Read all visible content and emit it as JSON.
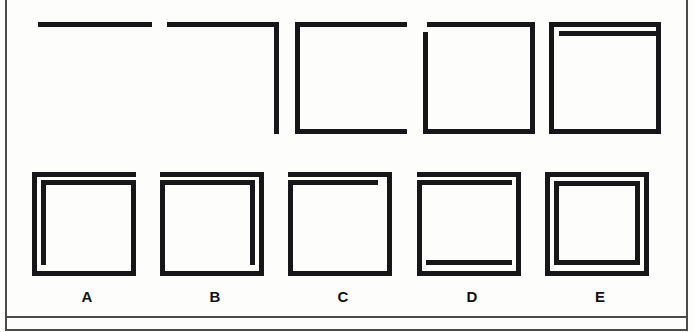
{
  "page": {
    "background_color": "#fdfdfb",
    "ink_color": "#17171a",
    "frame_color": "#4a4a4a"
  },
  "sequence": {
    "name": "problem-sequence",
    "description": "Top row: five progressive figures built from line segments that accumulate one stroke at a time.",
    "items": [
      {
        "index": 1,
        "name": "figure-1",
        "description": "Single horizontal line (top edge only)",
        "stroke_count": 1,
        "strokes": [
          "top"
        ]
      },
      {
        "index": 2,
        "name": "figure-2",
        "description": "Top edge plus right edge, forming an inverted L",
        "stroke_count": 2,
        "strokes": [
          "top",
          "right"
        ]
      },
      {
        "index": 3,
        "name": "figure-3",
        "description": "Top, left and bottom edges, forming a C open to the right",
        "stroke_count": 3,
        "strokes": [
          "top",
          "left",
          "bottom"
        ]
      },
      {
        "index": 4,
        "name": "figure-4",
        "description": "Full square outline with a small gap at the upper-left corner",
        "stroke_count": 4,
        "strokes": [
          "top",
          "right",
          "bottom",
          "left"
        ]
      },
      {
        "index": 5,
        "name": "figure-5",
        "description": "Full square outline plus a second inner horizontal line below the top edge",
        "stroke_count": 5,
        "strokes": [
          "top",
          "right",
          "bottom",
          "left",
          "inner-top"
        ]
      }
    ]
  },
  "options": {
    "name": "answer-options",
    "description": "Bottom row: five candidate answers labelled A through E.",
    "items": [
      {
        "letter": "A",
        "name": "option-a",
        "description": "Outer square plus inner top edge and inner left edge",
        "inner_strokes": [
          "inner-top",
          "inner-left"
        ]
      },
      {
        "letter": "B",
        "name": "option-b",
        "description": "Outer square plus inner top edge and inner right edge",
        "inner_strokes": [
          "inner-top",
          "inner-right"
        ]
      },
      {
        "letter": "C",
        "name": "option-c",
        "description": "Outer square plus a single short inner top edge",
        "inner_strokes": [
          "inner-top"
        ]
      },
      {
        "letter": "D",
        "name": "option-d",
        "description": "Outer square plus inner top, inner left and inner bottom edges",
        "inner_strokes": [
          "inner-top",
          "inner-left",
          "inner-bottom"
        ]
      },
      {
        "letter": "E",
        "name": "option-e",
        "description": "Outer square plus inner top, inner left, inner right and inner bottom edges",
        "inner_strokes": [
          "inner-top",
          "inner-left",
          "inner-right",
          "inner-bottom"
        ]
      }
    ]
  }
}
